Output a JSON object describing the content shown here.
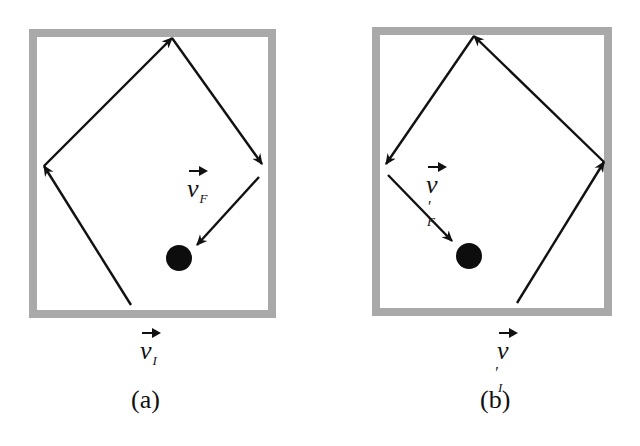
{
  "figure": {
    "panels": [
      {
        "id": "a",
        "caption": "(a)",
        "initial_velocity_label": {
          "symbol": "v",
          "subscript": "I",
          "prime": ""
        },
        "final_velocity_label": {
          "symbol": "v",
          "subscript": "F",
          "prime": ""
        },
        "box": {
          "x": 29,
          "y": 29,
          "width": 247,
          "height": 289
        },
        "path": [
          [
            131,
            305
          ],
          [
            44,
            166
          ],
          [
            172,
            38
          ],
          [
            262,
            164
          ]
        ],
        "final_segment": [
          [
            259,
            177
          ],
          [
            197,
            245
          ]
        ],
        "target_ball": {
          "cx": 179,
          "cy": 258,
          "r": 13
        }
      },
      {
        "id": "b",
        "caption": "(b)",
        "initial_velocity_label": {
          "symbol": "v",
          "subscript": "I",
          "prime": "′"
        },
        "final_velocity_label": {
          "symbol": "v",
          "subscript": "F",
          "prime": "′"
        },
        "box": {
          "x": 372,
          "y": 27,
          "width": 240,
          "height": 289
        },
        "path": [
          [
            517,
            303
          ],
          [
            604,
            162
          ],
          [
            474,
            36
          ],
          [
            386,
            164
          ]
        ],
        "final_segment": [
          [
            388,
            175
          ],
          [
            452,
            241
          ]
        ],
        "target_ball": {
          "cx": 469,
          "cy": 256,
          "r": 13
        }
      }
    ],
    "colors": {
      "wall": "#a9a9a9",
      "arrow": "#111111",
      "ball": "#0d0d0d",
      "background": "#ffffff"
    }
  }
}
